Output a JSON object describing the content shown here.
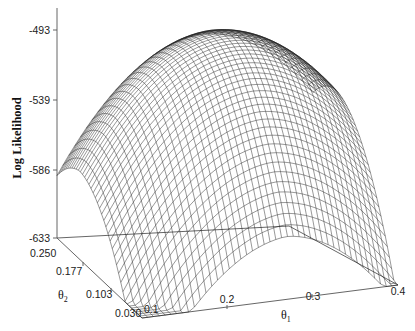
{
  "chart_data": {
    "type": "surface",
    "title": "",
    "zlabel": "Log Likelihood",
    "xlabel": "θ1",
    "ylabel": "θ2",
    "x_ticks": [
      "0.1",
      "0.2",
      "0.3",
      "0.4"
    ],
    "y_ticks": [
      "0.250",
      "0.177",
      "0.103",
      "0.030"
    ],
    "z_ticks": [
      "-493",
      "-539",
      "-586",
      "-633"
    ],
    "x_range": [
      0.1,
      0.4
    ],
    "y_range": [
      0.03,
      0.25
    ],
    "z_range": [
      -633,
      -493
    ],
    "grid": false,
    "style": "wireframe mesh, black lines on white",
    "peak_log_likelihood_approx": -495,
    "peak_location_approx": {
      "theta1": 0.27,
      "theta2": 0.19
    }
  },
  "labels": {
    "zlabel": "Log Likelihood",
    "theta1": "θ",
    "theta1_sub": "1",
    "theta2": "θ",
    "theta2_sub": "2",
    "z0": "-493",
    "z1": "-539",
    "z2": "-586",
    "z3": "-633",
    "y0": "0.250",
    "y1": "0.177",
    "y2": "0.103",
    "y3": "0.030",
    "x0": "0.1",
    "x1": "0.2",
    "x2": "0.3",
    "x3": "0.4"
  }
}
